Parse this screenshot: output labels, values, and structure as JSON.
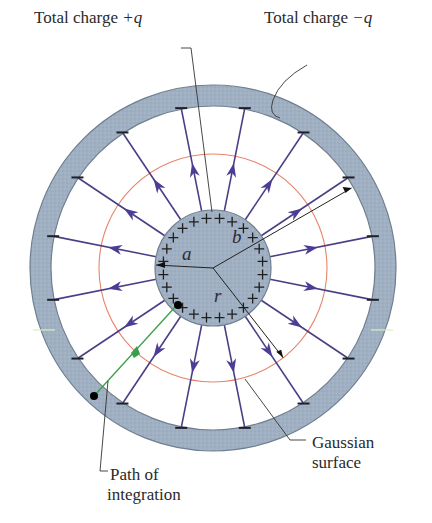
{
  "diagram": {
    "labels": {
      "inner_charge_prefix": "Total charge ",
      "inner_charge_value": "+q",
      "outer_charge_prefix": "Total charge ",
      "outer_charge_value": "−q",
      "gaussian_line1": "Gaussian",
      "gaussian_line2": "surface",
      "path_line1": "Path of",
      "path_line2": "integration"
    },
    "variables": {
      "a": "a",
      "b": "b",
      "r": "r"
    },
    "symbols": {
      "positive": "+",
      "negative": "−"
    },
    "geometry": {
      "center": [
        213,
        268
      ],
      "outer_shell_outer_radius": 183,
      "outer_shell_inner_radius": 162,
      "inner_sphere_radius": 58,
      "gaussian_radius": 114,
      "field_line_angles_deg": [
        0,
        22.5,
        45,
        67.5,
        90,
        112.5,
        135,
        157.5,
        180,
        202.5,
        225,
        247.5,
        270,
        292.5,
        315,
        337.5
      ],
      "plus_count": 24,
      "radius_b_angle_deg": -30,
      "radius_r_angle_deg": 52,
      "radius_a_angle_deg": 183
    },
    "colors": {
      "shell_fill": "#9fb0c2",
      "shell_stroke": "#6f7f90",
      "sphere_fill": "#a3b3c4",
      "field_line": "#4a3f86",
      "arrowhead": "#4b3d95",
      "gaussian": "#e8846a",
      "path": "#3aa048",
      "leader": "#333333",
      "text": "#2a2a2a"
    }
  }
}
